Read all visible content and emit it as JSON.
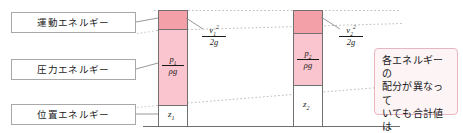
{
  "diagram": {
    "left_labels": [
      {
        "name": "kinetic-energy",
        "text": "運動エネルギー"
      },
      {
        "name": "pressure-energy",
        "text": "圧力エネルギー"
      },
      {
        "name": "potential-energy",
        "text": "位置エネルギー"
      }
    ],
    "bars": [
      {
        "id": "bar-1",
        "segments": [
          {
            "key": "velocity-head",
            "type": "fraction",
            "numerator": "v₁²",
            "num_base": "v",
            "num_sub": "1",
            "num_sup": "2",
            "denominator": "2g",
            "color": "#f4a0a8"
          },
          {
            "key": "pressure-head",
            "type": "fraction",
            "numerator": "p₁",
            "num_base": "p",
            "num_sub": "1",
            "num_sup": "",
            "denominator": "ρg",
            "color": "#fac5ce"
          },
          {
            "key": "elevation-head",
            "type": "scalar",
            "text_base": "z",
            "text_sub": "1",
            "color": "#ffffff"
          }
        ],
        "callout_formula": {
          "num_base": "v",
          "num_sub": "1",
          "num_sup": "2",
          "denominator": "2g"
        }
      },
      {
        "id": "bar-2",
        "segments": [
          {
            "key": "velocity-head",
            "type": "fraction",
            "numerator": "v₂²",
            "num_base": "v",
            "num_sub": "2",
            "num_sup": "2",
            "denominator": "2g",
            "color": "#f4a0a8"
          },
          {
            "key": "pressure-head",
            "type": "fraction",
            "numerator": "p₂",
            "num_base": "p",
            "num_sub": "2",
            "num_sup": "",
            "denominator": "ρg",
            "color": "#fac5ce"
          },
          {
            "key": "elevation-head",
            "type": "scalar",
            "text_base": "z",
            "text_sub": "2",
            "color": "#ffffff"
          }
        ],
        "callout_formula": {
          "num_base": "v",
          "num_sub": "2",
          "num_sup": "2",
          "denominator": "2g"
        }
      }
    ],
    "note": {
      "lines": [
        "各エネルギーの",
        "配分が異なって",
        "いても合計値は",
        "同じになる"
      ],
      "border_color": "#e8b6c0",
      "background_color": "#fdf4f6"
    },
    "colors": {
      "kinetic_fill": "#f4a0a8",
      "pressure_fill": "#fac5ce",
      "potential_fill": "#ffffff",
      "bar_outline": "#707070",
      "label_outline": "#a8a8a8",
      "dashed_guide": "#b9b9b9",
      "leader_line": "#8c8c8c",
      "baseline": "#6e6e6e"
    }
  }
}
